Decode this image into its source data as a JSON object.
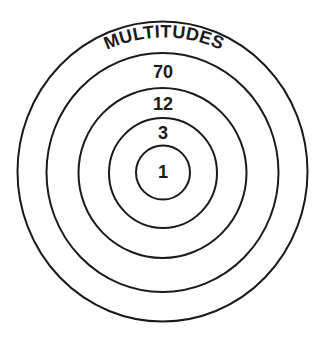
{
  "diagram": {
    "type": "concentric-circles",
    "title": "MULTITUDES",
    "rings": [
      {
        "label": "1",
        "position": "innermost"
      },
      {
        "label": "3",
        "position": "ring-2"
      },
      {
        "label": "12",
        "position": "ring-3"
      },
      {
        "label": "70",
        "position": "ring-4"
      },
      {
        "label": "MULTITUDES",
        "position": "outermost"
      }
    ],
    "colors": {
      "stroke": "#1a1a1a",
      "background": "#ffffff"
    }
  }
}
